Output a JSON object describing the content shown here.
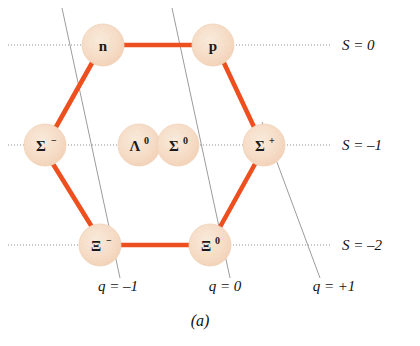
{
  "figure": {
    "caption": "(a)",
    "colors": {
      "node_fill": "#fae0ca",
      "node_edge": "#f3d2b6",
      "bond": "#ee4f1f",
      "guide_line": "#8a8a8a",
      "text": "#1a1a1a",
      "background": "#ffffff"
    }
  },
  "nodes": [
    {
      "id": "n",
      "base": "n",
      "sup": "",
      "cx": 103,
      "cy": 45,
      "r": 21
    },
    {
      "id": "p",
      "base": "p",
      "sup": "",
      "cx": 213,
      "cy": 45,
      "r": 21
    },
    {
      "id": "sigma-minus",
      "base": "Σ",
      "sup": "−",
      "cx": 45,
      "cy": 145,
      "r": 21
    },
    {
      "id": "lambda-zero",
      "base": "Λ",
      "sup": "0",
      "cx": 139,
      "cy": 145,
      "r": 21
    },
    {
      "id": "sigma-zero",
      "base": "Σ",
      "sup": "0",
      "cx": 178,
      "cy": 145,
      "r": 21
    },
    {
      "id": "sigma-plus",
      "base": "Σ",
      "sup": "+",
      "cx": 264,
      "cy": 145,
      "r": 21
    },
    {
      "id": "xi-minus",
      "base": "Ξ",
      "sup": "−",
      "cx": 100,
      "cy": 245,
      "r": 21
    },
    {
      "id": "xi-zero",
      "base": "Ξ",
      "sup": "0",
      "cx": 210,
      "cy": 245,
      "r": 21
    }
  ],
  "bonds": [
    {
      "from": "n",
      "to": "p"
    },
    {
      "from": "n",
      "to": "sigma-minus"
    },
    {
      "from": "p",
      "to": "sigma-plus"
    },
    {
      "from": "sigma-minus",
      "to": "xi-minus"
    },
    {
      "from": "sigma-plus",
      "to": "xi-zero"
    },
    {
      "from": "xi-minus",
      "to": "xi-zero"
    }
  ],
  "strangeness_axes": [
    {
      "id": "s-0",
      "label": "S = 0",
      "y": 45,
      "x1": 8,
      "x2": 330,
      "label_x": 342,
      "label_y": 45
    },
    {
      "id": "s-m1",
      "label": "S = –1",
      "y": 145,
      "x1": 8,
      "x2": 330,
      "label_x": 342,
      "label_y": 145
    },
    {
      "id": "s-m2",
      "label": "S = –2",
      "y": 245,
      "x1": 8,
      "x2": 330,
      "label_x": 342,
      "label_y": 245
    }
  ],
  "charge_axes": [
    {
      "id": "q-m1",
      "label": "q = –1",
      "x1": 62,
      "y1": 8,
      "x2": 120,
      "y2": 278,
      "label_x": 118,
      "label_y": 287
    },
    {
      "id": "q-0",
      "label": "q = 0",
      "x1": 172,
      "y1": 8,
      "x2": 230,
      "y2": 278,
      "label_x": 225,
      "label_y": 287
    },
    {
      "id": "q-p1",
      "label": "q = +1",
      "x1": 262,
      "y1": 122,
      "x2": 320,
      "y2": 278,
      "label_x": 330,
      "label_y": 287
    }
  ],
  "axis_titles": {
    "strangeness_symbol": "S",
    "charge_symbol": "q"
  }
}
